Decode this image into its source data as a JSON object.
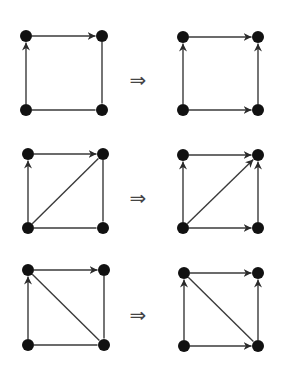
{
  "diagram": {
    "colors": {
      "node": "#111111",
      "edge": "#3a3a3a",
      "symbol": "#444444"
    },
    "implies_symbol": "⇒",
    "node_radius": 6,
    "rows": [
      {
        "implies_pos": [
          138,
          80
        ],
        "left": {
          "nodes": {
            "TL": [
              26,
              36
            ],
            "TR": [
              102,
              36
            ],
            "BL": [
              26,
              110
            ],
            "BR": [
              102,
              110
            ]
          },
          "edges": [
            {
              "from": "TL",
              "to": "TR",
              "directed": true
            },
            {
              "from": "BL",
              "to": "TL",
              "directed": true
            },
            {
              "from": "TR",
              "to": "BR",
              "directed": false
            },
            {
              "from": "BL",
              "to": "BR",
              "directed": false
            }
          ]
        },
        "right": {
          "nodes": {
            "TL": [
              183,
              37
            ],
            "TR": [
              258,
              37
            ],
            "BL": [
              183,
              110
            ],
            "BR": [
              258,
              110
            ]
          },
          "edges": [
            {
              "from": "TL",
              "to": "TR",
              "directed": true
            },
            {
              "from": "BL",
              "to": "TL",
              "directed": true
            },
            {
              "from": "BL",
              "to": "BR",
              "directed": true
            },
            {
              "from": "BR",
              "to": "TR",
              "directed": true
            }
          ]
        }
      },
      {
        "implies_pos": [
          138,
          198
        ],
        "left": {
          "nodes": {
            "TL": [
              28,
              154
            ],
            "TR": [
              103,
              154
            ],
            "BL": [
              28,
              228
            ],
            "BR": [
              103,
              228
            ]
          },
          "edges": [
            {
              "from": "TL",
              "to": "TR",
              "directed": true
            },
            {
              "from": "BL",
              "to": "TL",
              "directed": true
            },
            {
              "from": "BL",
              "to": "TR",
              "directed": false
            },
            {
              "from": "TR",
              "to": "BR",
              "directed": false
            },
            {
              "from": "BL",
              "to": "BR",
              "directed": false
            }
          ]
        },
        "right": {
          "nodes": {
            "TL": [
              183,
              155
            ],
            "TR": [
              258,
              155
            ],
            "BL": [
              183,
              228
            ],
            "BR": [
              258,
              228
            ]
          },
          "edges": [
            {
              "from": "TL",
              "to": "TR",
              "directed": true
            },
            {
              "from": "BL",
              "to": "TL",
              "directed": true
            },
            {
              "from": "BL",
              "to": "TR",
              "directed": true
            },
            {
              "from": "BL",
              "to": "BR",
              "directed": true
            },
            {
              "from": "BR",
              "to": "TR",
              "directed": true
            }
          ]
        }
      },
      {
        "implies_pos": [
          138,
          315
        ],
        "left": {
          "nodes": {
            "TL": [
              28,
              270
            ],
            "TR": [
              104,
              270
            ],
            "BL": [
              28,
              345
            ],
            "BR": [
              104,
              345
            ]
          },
          "edges": [
            {
              "from": "TL",
              "to": "TR",
              "directed": true
            },
            {
              "from": "BL",
              "to": "TL",
              "directed": true
            },
            {
              "from": "TL",
              "to": "BR",
              "directed": false
            },
            {
              "from": "TR",
              "to": "BR",
              "directed": false
            },
            {
              "from": "BL",
              "to": "BR",
              "directed": false
            }
          ]
        },
        "right": {
          "nodes": {
            "TL": [
              184,
              273
            ],
            "TR": [
              258,
              273
            ],
            "BL": [
              184,
              346
            ],
            "BR": [
              258,
              346
            ]
          },
          "edges": [
            {
              "from": "TL",
              "to": "TR",
              "directed": true
            },
            {
              "from": "BL",
              "to": "TL",
              "directed": true
            },
            {
              "from": "TL",
              "to": "BR",
              "directed": false
            },
            {
              "from": "BL",
              "to": "BR",
              "directed": true
            },
            {
              "from": "BR",
              "to": "TR",
              "directed": true
            }
          ]
        }
      }
    ]
  }
}
